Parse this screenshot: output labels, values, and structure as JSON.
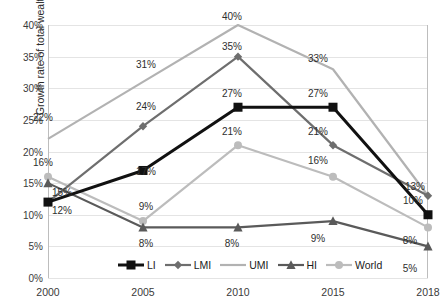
{
  "chart_data": {
    "type": "line",
    "title": "",
    "xlabel": "",
    "ylabel": "Growth rate of total wealth",
    "categories": [
      "2000",
      "2005",
      "2010",
      "2015",
      "2018"
    ],
    "ylim": [
      0,
      40
    ],
    "ytick_labels": [
      "0%",
      "5%",
      "10%",
      "15%",
      "20%",
      "25%",
      "30%",
      "35%",
      "40%"
    ],
    "ytick_values": [
      0,
      5,
      10,
      15,
      20,
      25,
      30,
      35,
      40
    ],
    "grid": true,
    "legend_position": "bottom-center",
    "series": [
      {
        "name": "LI",
        "color": "#111111",
        "marker": "square",
        "values": [
          12,
          17,
          27,
          27,
          10
        ],
        "labels": [
          "12%",
          "17%",
          "27%",
          "27%",
          "10%"
        ]
      },
      {
        "name": "LMI",
        "color": "#6e6e6e",
        "marker": "diamond",
        "values": [
          12,
          24,
          35,
          21,
          13
        ],
        "labels": [
          "12%",
          "24%",
          "35%",
          "21%",
          "13%"
        ]
      },
      {
        "name": "UMI",
        "color": "#b2b2b2",
        "marker": "none",
        "values": [
          22,
          31,
          40,
          33,
          13
        ],
        "labels": [
          "22%",
          "31%",
          "40%",
          "33%",
          "13%"
        ]
      },
      {
        "name": "HI",
        "color": "#5a5a5a",
        "marker": "triangle",
        "values": [
          15,
          8,
          8,
          9,
          5
        ],
        "labels": [
          "15%",
          "8%",
          "8%",
          "9%",
          "5%"
        ]
      },
      {
        "name": "World",
        "color": "#bcbcbc",
        "marker": "circle",
        "values": [
          16,
          9,
          21,
          16,
          8
        ],
        "labels": [
          "16%",
          "9%",
          "21%",
          "16%",
          "8%"
        ]
      }
    ],
    "data_labels": [
      {
        "text": "40%",
        "x": 232,
        "y": 16
      },
      {
        "text": "35%",
        "x": 232,
        "y": 46
      },
      {
        "text": "33%",
        "x": 318,
        "y": 58
      },
      {
        "text": "31%",
        "x": 146,
        "y": 64
      },
      {
        "text": "27%",
        "x": 232,
        "y": 93
      },
      {
        "text": "27%",
        "x": 318,
        "y": 93
      },
      {
        "text": "24%",
        "x": 146,
        "y": 106
      },
      {
        "text": "22%",
        "x": 43,
        "y": 117
      },
      {
        "text": "21%",
        "x": 232,
        "y": 131
      },
      {
        "text": "21%",
        "x": 318,
        "y": 131
      },
      {
        "text": "16%",
        "x": 43,
        "y": 162
      },
      {
        "text": "16%",
        "x": 318,
        "y": 160
      },
      {
        "text": "17%",
        "x": 146,
        "y": 171
      },
      {
        "text": "15%",
        "x": 62,
        "y": 192
      },
      {
        "text": "13%",
        "x": 415,
        "y": 186
      },
      {
        "text": "12%",
        "x": 62,
        "y": 210
      },
      {
        "text": "10%",
        "x": 413,
        "y": 200
      },
      {
        "text": "9%",
        "x": 146,
        "y": 206
      },
      {
        "text": "9%",
        "x": 318,
        "y": 238
      },
      {
        "text": "8%",
        "x": 146,
        "y": 243
      },
      {
        "text": "8%",
        "x": 232,
        "y": 243
      },
      {
        "text": "8%",
        "x": 410,
        "y": 240
      },
      {
        "text": "5%",
        "x": 410,
        "y": 268
      }
    ]
  }
}
